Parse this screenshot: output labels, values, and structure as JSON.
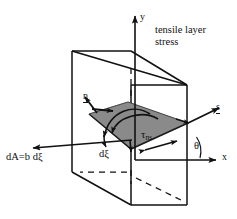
{
  "figure": {
    "kind": "engineering-stress-diagram",
    "background_color": "#ffffff",
    "line_color": "#111111",
    "plane_fill_color": "#8a8a8a",
    "plane_edge_color": "#1a1a1a"
  },
  "axes": {
    "y_label": "y",
    "x_label": "x",
    "angle_label": "θ"
  },
  "vectors": {
    "normal_label": "n",
    "tangent_label": "s"
  },
  "annotations": {
    "tensile_note_line1": "tensile layer",
    "tensile_note_line2": "stress",
    "shear_stress_symbol": "τ",
    "shear_stress_subscript": "ns",
    "element_thickness_label": "dξ",
    "area_label": "dA=b dξ"
  }
}
